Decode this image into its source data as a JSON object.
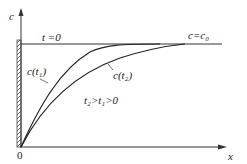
{
  "diagram": {
    "axis_y_label": "c",
    "axis_x_label": "x",
    "origin_label": "0",
    "initial_label": "t =0",
    "boundary_label": "c=c₀",
    "curve1_label": "c(t₁)",
    "curve2_label": "c(t₂)",
    "condition_label": "t₂>t₁>0"
  },
  "colors": {
    "line": "#333333",
    "background": "#ffffff"
  }
}
